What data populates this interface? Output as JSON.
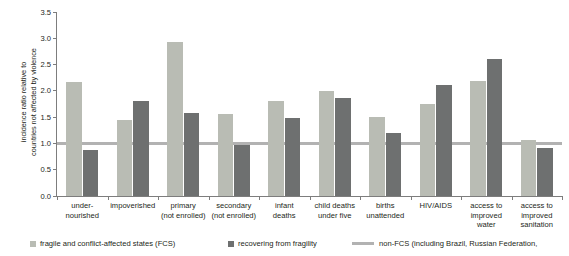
{
  "chart_data": {
    "type": "bar",
    "title": "",
    "subtitle": "",
    "xlabel": "",
    "ylabel": "incidence ratio relative to countries not affected by violence",
    "ylim": [
      0.0,
      3.5
    ],
    "yticks": [
      "0.0",
      "0.5",
      "1.0",
      "1.5",
      "2.0",
      "2.5",
      "3.0",
      "3.5"
    ],
    "ytick_values": [
      0.0,
      0.5,
      1.0,
      1.5,
      2.0,
      2.5,
      3.0,
      3.5
    ],
    "grid": false,
    "legend_position": "bottom",
    "reference_line": {
      "value": 1.0,
      "label": "non-FCS (including Brazil, Russian Federation,",
      "color": "#b2b2b2"
    },
    "categories": [
      "under-nourished",
      "impoverished",
      "primary (not enrolled)",
      "secondary (not enrolled)",
      "infant deaths",
      "child deaths under five",
      "births unattended",
      "HIV/AIDS",
      "access to improved water",
      "access to improved sanitation"
    ],
    "category_lines": [
      [
        "under-",
        "nourished"
      ],
      [
        "impoverished"
      ],
      [
        "primary",
        "(not enrolled)"
      ],
      [
        "secondary",
        "(not enrolled)"
      ],
      [
        "infant",
        "deaths"
      ],
      [
        "child deaths",
        "under five"
      ],
      [
        "births",
        "unattended"
      ],
      [
        "HIV/AIDS"
      ],
      [
        "access to",
        "improved",
        "water"
      ],
      [
        "access to",
        "improved",
        "sanitation"
      ]
    ],
    "series": [
      {
        "name": "fragile and conflict-affected states (FCS)",
        "color": "#b9bcb4",
        "values": [
          2.16,
          1.45,
          2.93,
          1.56,
          1.81,
          1.99,
          1.51,
          1.75,
          2.19,
          1.06
        ]
      },
      {
        "name": "recovering from fragility",
        "color": "#6e7070",
        "values": [
          0.88,
          1.8,
          1.58,
          0.97,
          1.48,
          1.87,
          1.19,
          2.12,
          2.6,
          0.92
        ]
      }
    ]
  },
  "legend": {
    "items": [
      {
        "label": "fragile and conflict-affected states (FCS)",
        "type": "swatch",
        "color": "#b9bcb4"
      },
      {
        "label": "recovering from fragility",
        "type": "swatch",
        "color": "#6e7070"
      },
      {
        "label": "non-FCS (including Brazil, Russian Federation,",
        "type": "rule",
        "color": "#b2b2b2"
      }
    ]
  }
}
